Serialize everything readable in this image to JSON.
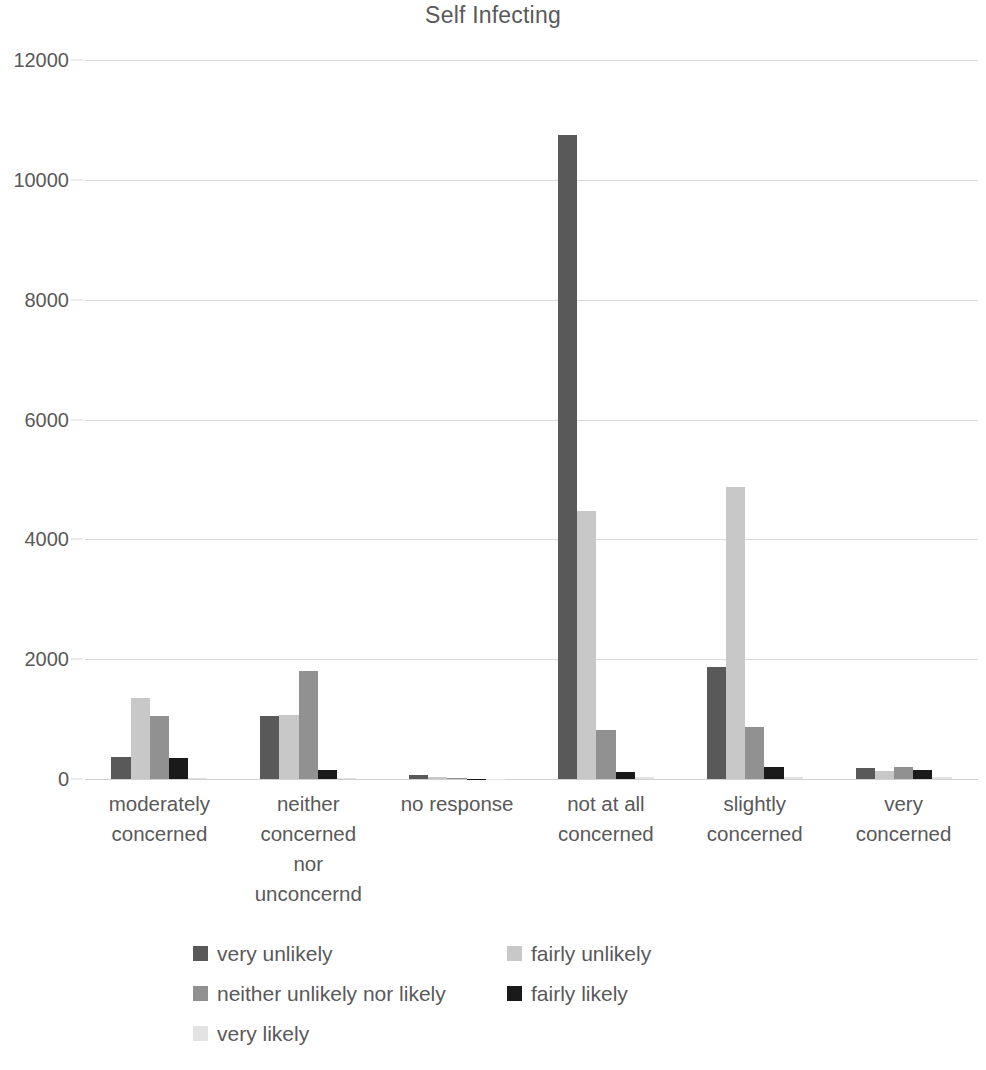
{
  "chart_data": {
    "type": "bar",
    "title": "Self Infecting",
    "xlabel": "",
    "ylabel": "",
    "ylim": [
      0,
      12000
    ],
    "y_ticks": [
      0,
      2000,
      4000,
      6000,
      8000,
      10000,
      12000
    ],
    "y_tick_labels": [
      "0",
      "2000",
      "4000",
      "6000",
      "8000",
      "10000",
      "12000"
    ],
    "grid": true,
    "legend_position": "bottom",
    "categories": [
      "moderately concerned",
      "neither concerned nor unconcernd",
      "no response",
      "not at all concerned",
      "slightly concerned",
      "very concerned"
    ],
    "category_lines": [
      [
        "moderately",
        "concerned"
      ],
      [
        "neither",
        "concerned",
        "nor",
        "unconcernd"
      ],
      [
        "no response"
      ],
      [
        "not at all",
        "concerned"
      ],
      [
        "slightly",
        "concerned"
      ],
      [
        "very",
        "concerned"
      ]
    ],
    "series": [
      {
        "name": "very unlikely",
        "color": "#595959",
        "values": [
          370,
          1050,
          70,
          10750,
          1870,
          180
        ]
      },
      {
        "name": "fairly unlikely",
        "color": "#c8c8c8",
        "values": [
          1350,
          1070,
          30,
          4470,
          4880,
          140
        ]
      },
      {
        "name": "neither unlikely nor likely",
        "color": "#919191",
        "values": [
          1050,
          1810,
          10,
          820,
          860,
          200
        ]
      },
      {
        "name": "fairly likely",
        "color": "#1a1a1a",
        "values": [
          355,
          155,
          5,
          120,
          200,
          150
        ]
      },
      {
        "name": "very likely",
        "color": "#e3e3e3",
        "values": [
          25,
          20,
          3,
          40,
          35,
          30
        ]
      }
    ]
  },
  "legend": {
    "rows": [
      [
        {
          "label": "very unlikely",
          "color": "#595959"
        },
        {
          "label": "fairly unlikely",
          "color": "#c8c8c8"
        }
      ],
      [
        {
          "label": "neither unlikely nor likely",
          "color": "#919191"
        },
        {
          "label": "fairly likely",
          "color": "#1a1a1a"
        }
      ],
      [
        {
          "label": "very likely",
          "color": "#e3e3e3"
        }
      ]
    ]
  },
  "colors": {
    "background": "#ffffff",
    "text": "#595959",
    "gridline": "#d9d9d9"
  }
}
